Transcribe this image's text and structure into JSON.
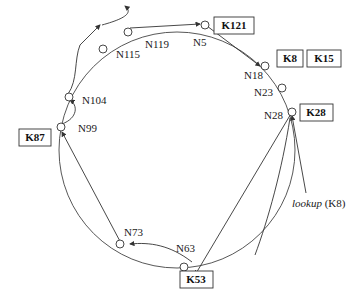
{
  "diagram": {
    "nodes": [
      {
        "id": "N5",
        "label": "N5"
      },
      {
        "id": "N18",
        "label": "N18"
      },
      {
        "id": "N23",
        "label": "N23"
      },
      {
        "id": "N28",
        "label": "N28"
      },
      {
        "id": "N63",
        "label": "N63"
      },
      {
        "id": "N73",
        "label": "N73"
      },
      {
        "id": "N99",
        "label": "N99"
      },
      {
        "id": "N104",
        "label": "N104"
      },
      {
        "id": "N115",
        "label": "N115"
      },
      {
        "id": "N119",
        "label": "N119"
      }
    ],
    "keys": [
      {
        "id": "K121",
        "label": "K121"
      },
      {
        "id": "K8",
        "label": "K8"
      },
      {
        "id": "K15",
        "label": "K15"
      },
      {
        "id": "K28",
        "label": "K28"
      },
      {
        "id": "K53",
        "label": "K53"
      },
      {
        "id": "K87",
        "label": "K87"
      }
    ],
    "lookup": {
      "word": "lookup",
      "arg": " (K8)"
    },
    "path": [
      "N28",
      "N63",
      "N73",
      "N99",
      "N104",
      "N115",
      "N119",
      "N5",
      "N18"
    ]
  }
}
